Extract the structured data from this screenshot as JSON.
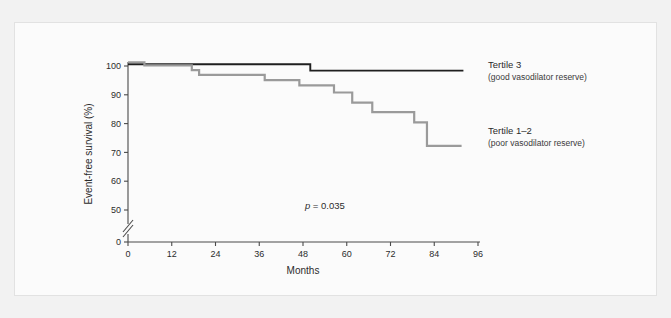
{
  "figure": {
    "background_color": "#f2f2f2",
    "panel_color": "#fbfbfb",
    "panel_border_color": "#e2e2e2"
  },
  "chart_data": {
    "type": "line",
    "title": "",
    "xlabel": "Months",
    "ylabel": "Event-free survival (%)",
    "xlim": [
      0,
      96
    ],
    "ylim": [
      45,
      102
    ],
    "y_axis_break": true,
    "y_break_between": [
      0,
      50
    ],
    "grid": false,
    "legend_position": "right",
    "xticks": [
      0,
      12,
      24,
      36,
      48,
      60,
      72,
      84,
      96
    ],
    "xtick_labels": [
      "0",
      "12",
      "24",
      "36",
      "48",
      "60",
      "72",
      "84",
      "96"
    ],
    "yticks": [
      0,
      50,
      60,
      70,
      80,
      90,
      100
    ],
    "ytick_labels": [
      "0",
      "50",
      "60",
      "70",
      "80",
      "90",
      "100"
    ],
    "annotations": [
      {
        "name": "p-value",
        "text_italic": "p",
        "text": " = 0.035",
        "x": 54,
        "y": 50.5
      }
    ],
    "series": [
      {
        "name": "Tertile 3",
        "sublabel": "(good vasodilator reserve)",
        "color": "#1f1f1f",
        "stroke_width": 1.9,
        "legend_x": 96,
        "legend_y": 99.2,
        "steps": [
          {
            "x": 0,
            "y": 100.6
          },
          {
            "x": 50,
            "y": 100.6
          },
          {
            "x": 50,
            "y": 98.4
          },
          {
            "x": 92,
            "y": 98.4
          }
        ]
      },
      {
        "name": "Tertile 1–2",
        "sublabel": "(poor vasodilator reserve)",
        "color": "#9a9a9a",
        "stroke_width": 2.2,
        "legend_x": 96,
        "legend_y": 76.5,
        "steps": [
          {
            "x": 0,
            "y": 101.3
          },
          {
            "x": 4.5,
            "y": 101.3
          },
          {
            "x": 4.5,
            "y": 100.2
          },
          {
            "x": 17.5,
            "y": 100.2
          },
          {
            "x": 17.5,
            "y": 98.6
          },
          {
            "x": 19.5,
            "y": 98.6
          },
          {
            "x": 19.5,
            "y": 96.9
          },
          {
            "x": 37.5,
            "y": 96.9
          },
          {
            "x": 37.5,
            "y": 95.1
          },
          {
            "x": 47.0,
            "y": 95.1
          },
          {
            "x": 47.0,
            "y": 93.3
          },
          {
            "x": 56.5,
            "y": 93.3
          },
          {
            "x": 56.5,
            "y": 90.8
          },
          {
            "x": 61.5,
            "y": 90.8
          },
          {
            "x": 61.5,
            "y": 87.3
          },
          {
            "x": 67.0,
            "y": 87.3
          },
          {
            "x": 67.0,
            "y": 84.0
          },
          {
            "x": 78.5,
            "y": 84.0
          },
          {
            "x": 78.5,
            "y": 80.4
          },
          {
            "x": 82.0,
            "y": 80.4
          },
          {
            "x": 82.0,
            "y": 72.3
          },
          {
            "x": 91.5,
            "y": 72.3
          }
        ]
      }
    ]
  }
}
